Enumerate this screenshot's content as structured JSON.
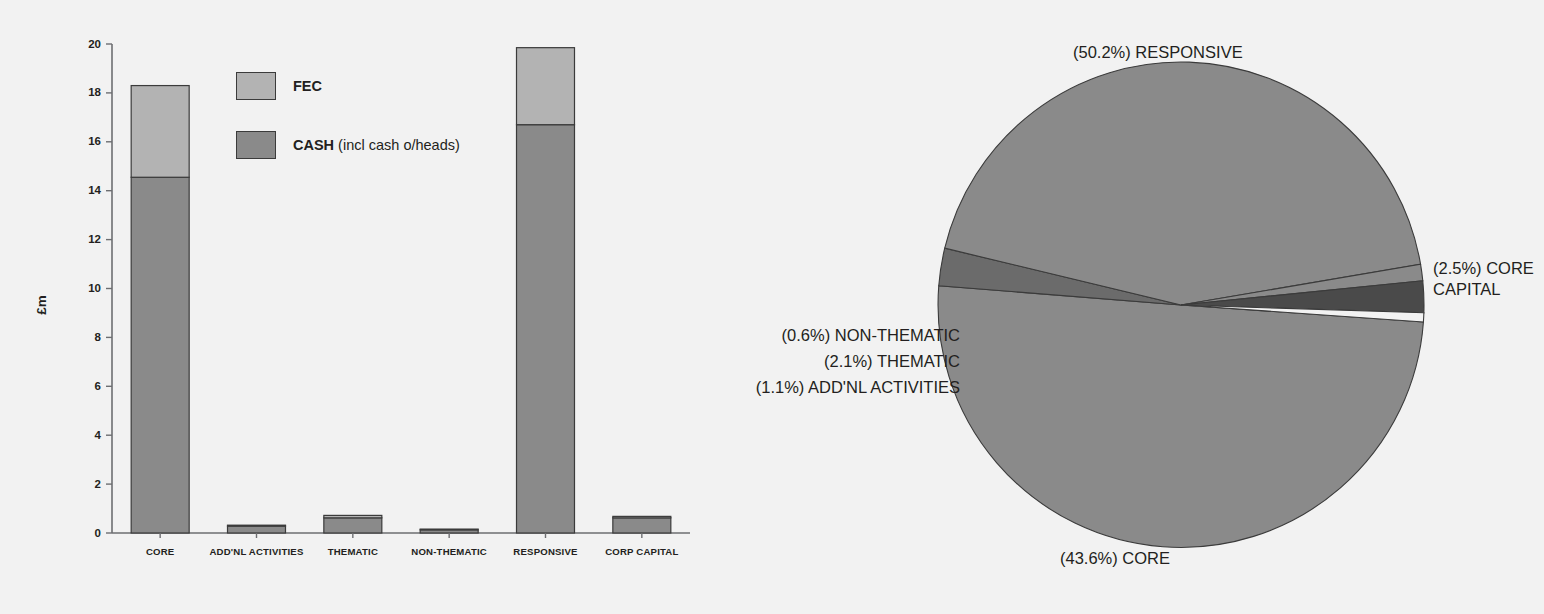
{
  "chart_data": [
    {
      "type": "bar",
      "id": "stacked-bar-funding",
      "title": "",
      "xlabel": "",
      "ylabel": "£m",
      "ylim": [
        0,
        20
      ],
      "ytick_step": 2,
      "yticks": [
        0,
        2,
        4,
        6,
        8,
        10,
        12,
        14,
        16,
        18,
        20
      ],
      "grid": false,
      "stacked": true,
      "legend_position": "inside-top-left",
      "categories": [
        "CORE",
        "ADD'NL ACTIVITIES",
        "THEMATIC",
        "NON-THEMATIC",
        "RESPONSIVE",
        "CORP CAPITAL"
      ],
      "series": [
        {
          "name": "CASH",
          "legend_label": "CASH",
          "legend_note": " (incl cash o/heads)",
          "color": "#8a8a8a",
          "values": [
            14.55,
            0.28,
            0.62,
            0.13,
            16.7,
            0.62
          ]
        },
        {
          "name": "FEC",
          "legend_label": "FEC",
          "legend_note": "",
          "color": "#b3b3b3",
          "values": [
            3.75,
            0.04,
            0.1,
            0.03,
            3.15,
            0.06
          ]
        }
      ],
      "totals": [
        18.3,
        0.32,
        0.72,
        0.16,
        19.85,
        0.68
      ]
    },
    {
      "type": "pie",
      "id": "pie-funding-share",
      "title": "",
      "labels": [
        "RESPONSIVE",
        "CORE CAPITAL",
        "CORE",
        "ADD'NL ACTIVITIES",
        "THEMATIC",
        "NON-THEMATIC"
      ],
      "values": [
        50.2,
        2.5,
        43.6,
        1.1,
        2.1,
        0.6
      ],
      "unit": "%",
      "label_texts": [
        "(50.2%) RESPONSIVE",
        "(2.5%) CORE CAPITAL",
        "(43.6%) CORE",
        "(1.1%) ADD'NL ACTIVITIES",
        "(2.1%) THEMATIC",
        "(0.6%) NON-THEMATIC"
      ],
      "colors": [
        "#8a8a8a",
        "#6b6b6b",
        "#8a8a8a",
        "#8a8a8a",
        "#4a4a4a",
        "#f2f2f2"
      ],
      "start_angle_deg": 4,
      "direction": "clockwise"
    }
  ],
  "bar": {
    "ylabel": "£m",
    "yticks": [
      "0",
      "2",
      "4",
      "6",
      "8",
      "10",
      "12",
      "14",
      "16",
      "18",
      "20"
    ],
    "categories": [
      "CORE",
      "ADD'NL ACTIVITIES",
      "THEMATIC",
      "NON-THEMATIC",
      "RESPONSIVE",
      "CORP CAPITAL"
    ],
    "legend": {
      "fec_label": "FEC",
      "cash_label": "CASH",
      "cash_note": " (incl cash o/heads)"
    }
  },
  "pie": {
    "labels": {
      "responsive": "(50.2%) RESPONSIVE",
      "core_capital_line1": "(2.5%) CORE",
      "core_capital_line2": "CAPITAL",
      "core": "(43.6%) CORE",
      "non_thematic": "(0.6%) NON-THEMATIC",
      "thematic": "(2.1%) THEMATIC",
      "addnl_activities": "(1.1%) ADD'NL ACTIVITIES"
    }
  },
  "colors": {
    "fec": "#b3b3b3",
    "cash": "#8a8a8a",
    "outline": "#3b3b3b",
    "axis": "#6d6e71",
    "background": "#f2f2f2",
    "text": "#231f20"
  }
}
